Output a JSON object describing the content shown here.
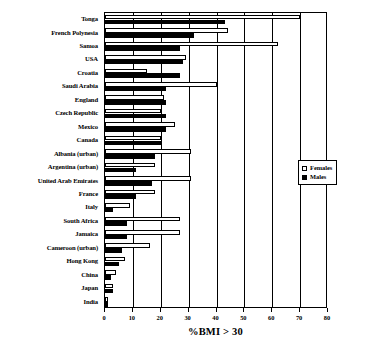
{
  "chart_data": {
    "type": "bar",
    "orientation": "horizontal",
    "title": "",
    "xlabel": "%BMI > 30",
    "ylabel": "",
    "xlim": [
      0,
      80
    ],
    "xticks": [
      0,
      10,
      20,
      30,
      40,
      50,
      60,
      70,
      80
    ],
    "grid": true,
    "grid_axis": "x",
    "legend_position": "right",
    "categories": [
      "Tonga",
      "French Polynesia",
      "Samoa",
      "USA",
      "Croatia",
      "Saudi Arabia",
      "England",
      "Czech Republic",
      "Mexico",
      "Canada",
      "Albania (urban)",
      "Argentina (urban)",
      "United Arab Emirates",
      "France",
      "Italy",
      "South Africa",
      "Jamaica",
      "Cameroon (urban)",
      "Hong Kong",
      "China",
      "Japan",
      "India"
    ],
    "series": [
      {
        "name": "Females",
        "color": "#ffffff",
        "edgecolor": "#000000",
        "values": [
          70,
          44,
          62,
          29,
          15,
          40,
          21,
          20,
          25,
          20,
          31,
          18,
          31,
          18,
          9,
          27,
          27,
          16,
          7,
          4,
          3,
          1
        ]
      },
      {
        "name": "Males",
        "color": "#000000",
        "edgecolor": "#000000",
        "values": [
          43,
          32,
          27,
          28,
          27,
          22,
          22,
          22,
          22,
          20,
          18,
          11,
          17,
          11,
          3,
          8,
          8,
          6,
          5,
          2,
          3,
          1
        ]
      }
    ]
  },
  "legend": {
    "items": [
      {
        "label": "Females",
        "swatch": "open-square"
      },
      {
        "label": "Males",
        "swatch": "filled-square"
      }
    ]
  },
  "axis": {
    "x_title": "%BMI > 30",
    "tick_labels": [
      "0",
      "10",
      "20",
      "30",
      "40",
      "50",
      "60",
      "70",
      "80"
    ]
  }
}
